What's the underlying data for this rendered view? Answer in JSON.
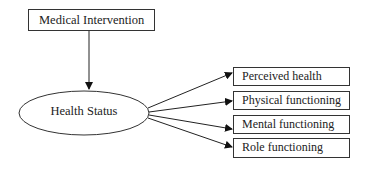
{
  "diagram": {
    "source_node": {
      "label": "Medical Intervention"
    },
    "central_node": {
      "label": "Health Status"
    },
    "outcome_nodes": [
      {
        "label": "Perceived health"
      },
      {
        "label": "Physical functioning"
      },
      {
        "label": "Mental functioning"
      },
      {
        "label": "Role functioning"
      }
    ],
    "edges": [
      {
        "from": "Medical Intervention",
        "to": "Health Status"
      },
      {
        "from": "Health Status",
        "to": "Perceived health"
      },
      {
        "from": "Health Status",
        "to": "Physical functioning"
      },
      {
        "from": "Health Status",
        "to": "Mental functioning"
      },
      {
        "from": "Health Status",
        "to": "Role functioning"
      }
    ]
  }
}
